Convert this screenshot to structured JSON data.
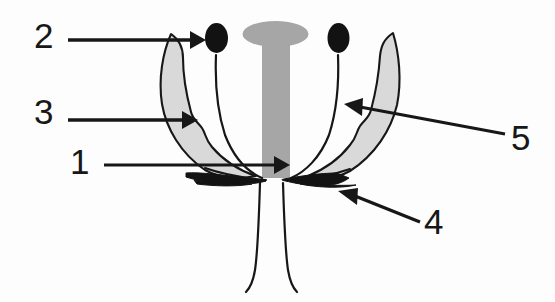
{
  "figure": {
    "type": "line-diagram",
    "background_color": "#fdfdfd",
    "ink_color": "#171717",
    "petal_fill_color": "#d9d9d9",
    "pistil_fill_color": "#a6a6a6",
    "anther_fill_color": "#121212"
  },
  "labels": [
    {
      "id": "1",
      "text": "1",
      "points_to": "ovary-base",
      "arrow_direction": "right"
    },
    {
      "id": "2",
      "text": "2",
      "points_to": "petal-tip-left",
      "arrow_direction": "right"
    },
    {
      "id": "3",
      "text": "3",
      "points_to": "petal-left",
      "arrow_direction": "right"
    },
    {
      "id": "4",
      "text": "4",
      "points_to": "sepal-right",
      "arrow_direction": "up-left"
    },
    {
      "id": "5",
      "text": "5",
      "points_to": "petal-right",
      "arrow_direction": "up-left"
    }
  ],
  "parts": [
    {
      "name": "pistil-stigma-cap",
      "shape": "ellipse",
      "fill": "#a6a6a6"
    },
    {
      "name": "pistil-style-column",
      "shape": "column",
      "fill": "#a6a6a6"
    },
    {
      "name": "stamen-left",
      "shape": "filament-with-anther",
      "fill": "#121212"
    },
    {
      "name": "stamen-right",
      "shape": "filament-with-anther",
      "fill": "#121212"
    },
    {
      "name": "petal-left",
      "shape": "crescent",
      "fill": "#d9d9d9"
    },
    {
      "name": "petal-right",
      "shape": "crescent",
      "fill": "#d9d9d9"
    },
    {
      "name": "sepal-left",
      "shape": "wedge",
      "fill": "#121212"
    },
    {
      "name": "sepal-right",
      "shape": "wedge",
      "fill": "#121212"
    },
    {
      "name": "flower-stalk",
      "shape": "two-curved-lines",
      "fill": "none"
    }
  ]
}
